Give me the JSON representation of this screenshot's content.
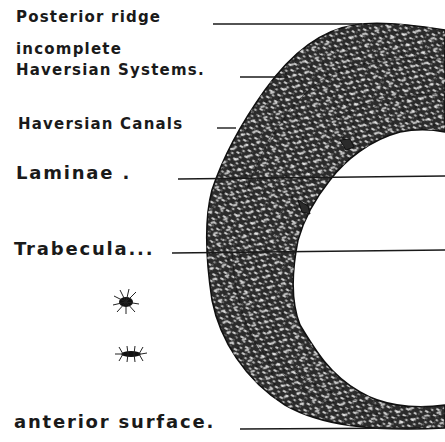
{
  "figure": {
    "colors": {
      "ink": "#1a1a1a",
      "bone_fill": "#2b2b2b",
      "background": "#ffffff"
    }
  },
  "labels": [
    {
      "id": "posterior-ridge",
      "text": "Posterior ridge",
      "x": 16,
      "y": 8,
      "line": {
        "x1": 213,
        "y1": 24,
        "x2": 362,
        "y2": 24
      }
    },
    {
      "id": "incomplete-1",
      "text": "incomplete",
      "x": 16,
      "y": 42
    },
    {
      "id": "incomplete-2",
      "text": "Haversian Systems.",
      "x": 16,
      "y": 63,
      "line": {
        "x1": 240,
        "y1": 77,
        "x2": 288,
        "y2": 77
      }
    },
    {
      "id": "haversian-canals",
      "text": "Haversian Canals",
      "x": 18,
      "y": 117,
      "line": {
        "x1": 217,
        "y1": 128,
        "x2": 236,
        "y2": 128
      }
    },
    {
      "id": "laminae",
      "text": "Laminae .",
      "x": 16,
      "y": 165,
      "line": {
        "x1": 178,
        "y1": 179,
        "x2": 445,
        "y2": 176
      }
    },
    {
      "id": "trabecula",
      "text": "Trabecula...",
      "x": 14,
      "y": 240,
      "line": {
        "x1": 172,
        "y1": 253,
        "x2": 445,
        "y2": 250
      }
    },
    {
      "id": "anterior-surface",
      "text": "anterior surface.",
      "x": 14,
      "y": 413,
      "line": {
        "x1": 240,
        "y1": 429,
        "x2": 420,
        "y2": 428
      }
    }
  ],
  "cells": [
    {
      "name": "bone-cell-stellate",
      "cx": 126,
      "cy": 302
    },
    {
      "name": "bone-cell-elongated",
      "cx": 131,
      "cy": 354
    }
  ]
}
